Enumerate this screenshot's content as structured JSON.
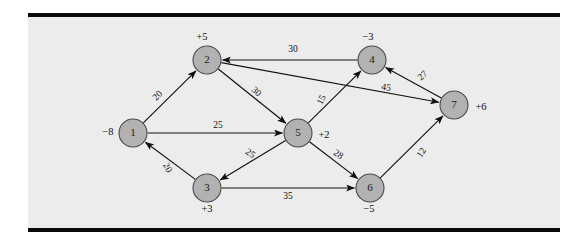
{
  "figure": {
    "kind": "network-flow-diagram",
    "background_color": "#ececec",
    "page_color": "#ffffff",
    "rule_color": "#0a0a0a",
    "node_fill": "#b2b2b2",
    "node_stroke": "#4a4a4a",
    "edge_color": "#111111"
  },
  "chart_data": {
    "type": "diagram",
    "title": "",
    "nodes": [
      {
        "id": "1",
        "label": "1",
        "supply": "−8",
        "x": 133,
        "y": 133,
        "r": 14,
        "supply_x": 108,
        "supply_y": 133
      },
      {
        "id": "2",
        "label": "2",
        "supply": "+5",
        "x": 207,
        "y": 60,
        "r": 14,
        "supply_x": 202,
        "supply_y": 38
      },
      {
        "id": "3",
        "label": "3",
        "supply": "+3",
        "x": 207,
        "y": 188,
        "r": 14,
        "supply_x": 207,
        "supply_y": 210
      },
      {
        "id": "4",
        "label": "4",
        "supply": "−3",
        "x": 372,
        "y": 60,
        "r": 14,
        "supply_x": 368,
        "supply_y": 38
      },
      {
        "id": "5",
        "label": "5",
        "supply": "+2",
        "x": 298,
        "y": 133,
        "r": 14,
        "supply_x": 324,
        "supply_y": 136
      },
      {
        "id": "6",
        "label": "6",
        "supply": "−5",
        "x": 370,
        "y": 188,
        "r": 14,
        "supply_x": 369,
        "supply_y": 210
      },
      {
        "id": "7",
        "label": "7",
        "supply": "+6",
        "x": 454,
        "y": 105,
        "r": 14,
        "supply_x": 481,
        "supply_y": 108
      }
    ],
    "edges": [
      {
        "from": "1",
        "to": "2",
        "cost": "20",
        "label_x": 158,
        "label_y": 96,
        "label_rot": -45
      },
      {
        "from": "1",
        "to": "5",
        "cost": "25",
        "label_x": 218,
        "label_y": 126,
        "label_rot": 0
      },
      {
        "from": "2",
        "to": "5",
        "cost": "30",
        "label_x": 256,
        "label_y": 92,
        "label_rot": 42
      },
      {
        "from": "2",
        "to": "7",
        "cost": "45",
        "label_x": 386,
        "label_y": 88,
        "label_rot": 9
      },
      {
        "from": "3",
        "to": "1",
        "cost": "20",
        "label_x": 167,
        "label_y": 168,
        "label_rot": 59
      },
      {
        "from": "3",
        "to": "6",
        "cost": "35",
        "label_x": 288,
        "label_y": 197,
        "label_rot": 0
      },
      {
        "from": "4",
        "to": "2",
        "cost": "30",
        "label_x": 293,
        "label_y": 50,
        "label_rot": 0
      },
      {
        "from": "5",
        "to": "3",
        "cost": "25",
        "label_x": 250,
        "label_y": 154,
        "label_rot": 35
      },
      {
        "from": "5",
        "to": "4",
        "cost": "15",
        "label_x": 322,
        "label_y": 100,
        "label_rot": -64
      },
      {
        "from": "5",
        "to": "6",
        "cost": "28",
        "label_x": 338,
        "label_y": 155,
        "label_rot": 35
      },
      {
        "from": "6",
        "to": "7",
        "cost": "12",
        "label_x": 422,
        "label_y": 153,
        "label_rot": -56
      },
      {
        "from": "7",
        "to": "4",
        "cost": "27",
        "label_x": 423,
        "label_y": 76,
        "label_rot": -42
      }
    ],
    "node_count": 7,
    "edge_count": 12
  }
}
